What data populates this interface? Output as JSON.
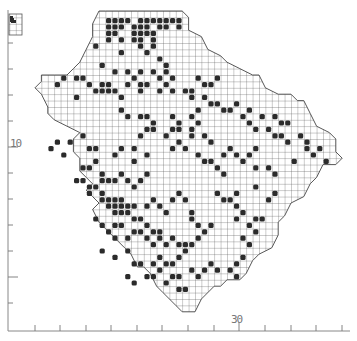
{
  "map": {
    "type": "grid-distribution-map",
    "colors": {
      "background": "#ffffff",
      "grid": "#555555",
      "filled": "#2b2b2b",
      "axis": "#777777",
      "outline": "#444444"
    },
    "grid": {
      "x0": 9.4,
      "y0": 4.6,
      "cell": 6.4
    },
    "axis": {
      "y_label": "10",
      "x_label": "30",
      "x_ticks": [
        35,
        60,
        86,
        111,
        137,
        162,
        188,
        214,
        239,
        265,
        291,
        316,
        342
      ],
      "y_ticks": [
        43,
        69,
        95,
        121,
        147,
        173,
        199,
        225,
        251,
        277,
        303
      ]
    },
    "outline": [
      [
        14,
        1
      ],
      [
        15,
        1
      ],
      [
        17,
        1
      ],
      [
        20,
        1
      ],
      [
        22,
        1
      ],
      [
        24,
        1
      ],
      [
        27,
        1
      ],
      [
        28,
        2
      ],
      [
        28,
        4
      ],
      [
        30,
        5
      ],
      [
        31,
        7
      ],
      [
        33,
        8
      ],
      [
        34,
        9
      ],
      [
        36,
        10
      ],
      [
        38,
        11
      ],
      [
        39,
        11
      ],
      [
        40,
        13
      ],
      [
        42,
        14
      ],
      [
        44,
        14
      ],
      [
        45,
        15
      ],
      [
        46,
        15
      ],
      [
        47,
        17
      ],
      [
        48,
        19
      ],
      [
        50,
        20
      ],
      [
        51,
        21
      ],
      [
        51,
        23
      ],
      [
        52,
        24
      ],
      [
        51,
        25
      ],
      [
        49,
        25
      ],
      [
        48,
        27
      ],
      [
        47,
        28
      ],
      [
        46,
        30
      ],
      [
        44,
        31
      ],
      [
        43,
        33
      ],
      [
        42,
        34
      ],
      [
        42,
        36
      ],
      [
        41,
        38
      ],
      [
        39,
        39
      ],
      [
        38,
        40
      ],
      [
        37,
        42
      ],
      [
        36,
        43
      ],
      [
        34,
        43
      ],
      [
        33,
        44
      ],
      [
        32,
        44
      ],
      [
        30,
        46
      ],
      [
        29,
        48
      ],
      [
        27,
        48
      ],
      [
        26,
        47
      ],
      [
        24,
        45
      ],
      [
        23,
        44
      ],
      [
        22,
        42
      ],
      [
        21,
        41
      ],
      [
        20,
        41
      ],
      [
        19,
        39
      ],
      [
        18,
        38
      ],
      [
        17,
        37
      ],
      [
        16,
        36
      ],
      [
        15,
        35
      ],
      [
        14,
        34
      ],
      [
        13,
        32
      ],
      [
        14,
        31
      ],
      [
        13,
        30
      ],
      [
        12,
        29
      ],
      [
        13,
        28
      ],
      [
        12,
        27
      ],
      [
        11,
        26
      ],
      [
        11,
        24
      ],
      [
        10,
        23
      ],
      [
        10,
        21
      ],
      [
        11,
        20
      ],
      [
        9,
        19
      ],
      [
        7,
        18
      ],
      [
        6,
        17
      ],
      [
        6,
        16
      ],
      [
        5,
        14
      ],
      [
        4,
        13
      ],
      [
        5,
        12
      ],
      [
        5,
        11
      ],
      [
        7,
        11
      ],
      [
        9,
        11
      ],
      [
        10,
        10
      ],
      [
        11,
        9
      ],
      [
        12,
        7
      ],
      [
        13,
        5
      ],
      [
        13,
        3
      ],
      [
        14,
        1
      ]
    ],
    "inset": {
      "x": 9,
      "y": 14,
      "w": 13,
      "h": 21
    },
    "inset_filled": [
      [
        10,
        16
      ],
      [
        10,
        17
      ],
      [
        11,
        18
      ],
      [
        10,
        19
      ],
      [
        11,
        20
      ],
      [
        12,
        20
      ],
      [
        13,
        20
      ]
    ],
    "filled": [
      [
        15,
        2
      ],
      [
        16,
        2
      ],
      [
        17,
        2
      ],
      [
        18,
        2
      ],
      [
        20,
        2
      ],
      [
        21,
        2
      ],
      [
        22,
        2
      ],
      [
        23,
        2
      ],
      [
        24,
        2
      ],
      [
        25,
        2
      ],
      [
        26,
        2
      ],
      [
        15,
        3
      ],
      [
        16,
        3
      ],
      [
        17,
        3
      ],
      [
        19,
        3
      ],
      [
        20,
        3
      ],
      [
        21,
        3
      ],
      [
        23,
        3
      ],
      [
        24,
        3
      ],
      [
        26,
        3
      ],
      [
        15,
        4
      ],
      [
        16,
        4
      ],
      [
        19,
        4
      ],
      [
        20,
        4
      ],
      [
        21,
        4
      ],
      [
        22,
        4
      ],
      [
        15,
        5
      ],
      [
        17,
        5
      ],
      [
        19,
        5
      ],
      [
        20,
        5
      ],
      [
        22,
        5
      ],
      [
        20,
        6
      ],
      [
        22,
        6
      ],
      [
        21,
        7
      ],
      [
        23,
        8
      ],
      [
        24,
        9
      ],
      [
        24,
        10
      ],
      [
        23,
        11
      ],
      [
        25,
        11
      ],
      [
        13,
        6
      ],
      [
        17,
        7
      ],
      [
        14,
        9
      ],
      [
        16,
        10
      ],
      [
        18,
        10
      ],
      [
        20,
        10
      ],
      [
        22,
        10
      ],
      [
        21,
        12
      ],
      [
        23,
        13
      ],
      [
        20,
        13
      ],
      [
        14,
        12
      ],
      [
        8,
        11
      ],
      [
        10,
        11
      ],
      [
        11,
        11
      ],
      [
        12,
        12
      ],
      [
        13,
        13
      ],
      [
        14,
        13
      ],
      [
        15,
        13
      ],
      [
        16,
        13
      ],
      [
        15,
        12
      ],
      [
        17,
        14
      ],
      [
        18,
        12
      ],
      [
        19,
        11
      ],
      [
        20,
        12
      ],
      [
        24,
        12
      ],
      [
        25,
        13
      ],
      [
        27,
        13
      ],
      [
        28,
        13
      ],
      [
        29,
        11
      ],
      [
        30,
        12
      ],
      [
        31,
        12
      ],
      [
        32,
        11
      ],
      [
        30,
        14
      ],
      [
        31,
        15
      ],
      [
        29,
        16
      ],
      [
        28,
        14
      ],
      [
        7,
        12
      ],
      [
        10,
        14
      ],
      [
        17,
        16
      ],
      [
        18,
        17
      ],
      [
        20,
        17
      ],
      [
        21,
        17
      ],
      [
        22,
        18
      ],
      [
        21,
        19
      ],
      [
        22,
        19
      ],
      [
        20,
        20
      ],
      [
        25,
        17
      ],
      [
        26,
        18
      ],
      [
        25,
        19
      ],
      [
        26,
        19
      ],
      [
        24,
        20
      ],
      [
        28,
        17
      ],
      [
        29,
        18
      ],
      [
        28,
        19
      ],
      [
        28,
        20
      ],
      [
        30,
        20
      ],
      [
        31,
        21
      ],
      [
        26,
        21
      ],
      [
        25,
        22
      ],
      [
        27,
        22
      ],
      [
        32,
        15
      ],
      [
        33,
        16
      ],
      [
        34,
        16
      ],
      [
        35,
        15
      ],
      [
        36,
        17
      ],
      [
        37,
        16
      ],
      [
        37,
        18
      ],
      [
        38,
        19
      ],
      [
        39,
        17
      ],
      [
        41,
        17
      ],
      [
        42,
        18
      ],
      [
        43,
        18
      ],
      [
        40,
        19
      ],
      [
        41,
        20
      ],
      [
        42,
        20
      ],
      [
        43,
        21
      ],
      [
        45,
        20
      ],
      [
        46,
        21
      ],
      [
        46,
        22
      ],
      [
        47,
        23
      ],
      [
        48,
        22
      ],
      [
        49,
        24
      ],
      [
        44,
        24
      ],
      [
        40,
        25
      ],
      [
        41,
        26
      ],
      [
        33,
        23
      ],
      [
        34,
        22
      ],
      [
        35,
        23
      ],
      [
        36,
        24
      ],
      [
        37,
        23
      ],
      [
        38,
        22
      ],
      [
        38,
        25
      ],
      [
        29,
        23
      ],
      [
        30,
        24
      ],
      [
        31,
        24
      ],
      [
        32,
        25
      ],
      [
        33,
        26
      ],
      [
        7,
        21
      ],
      [
        9,
        21
      ],
      [
        11,
        20
      ],
      [
        12,
        22
      ],
      [
        13,
        22
      ],
      [
        13,
        24
      ],
      [
        16,
        23
      ],
      [
        17,
        22
      ],
      [
        19,
        22
      ],
      [
        19,
        24
      ],
      [
        21,
        23
      ],
      [
        6,
        22
      ],
      [
        8,
        23
      ],
      [
        11,
        25
      ],
      [
        12,
        25
      ],
      [
        14,
        26
      ],
      [
        14,
        27
      ],
      [
        15,
        27
      ],
      [
        16,
        27
      ],
      [
        17,
        26
      ],
      [
        18,
        27
      ],
      [
        19,
        28
      ],
      [
        20,
        27
      ],
      [
        21,
        26
      ],
      [
        10,
        27
      ],
      [
        11,
        27
      ],
      [
        12,
        28
      ],
      [
        13,
        28
      ],
      [
        12,
        29
      ],
      [
        14,
        29
      ],
      [
        14,
        30
      ],
      [
        15,
        30
      ],
      [
        16,
        30
      ],
      [
        17,
        30
      ],
      [
        15,
        31
      ],
      [
        16,
        31
      ],
      [
        17,
        31
      ],
      [
        18,
        31
      ],
      [
        19,
        31
      ],
      [
        16,
        32
      ],
      [
        17,
        32
      ],
      [
        18,
        32
      ],
      [
        19,
        33
      ],
      [
        20,
        33
      ],
      [
        13,
        33
      ],
      [
        14,
        34
      ],
      [
        15,
        35
      ],
      [
        16,
        34
      ],
      [
        17,
        34
      ],
      [
        16,
        36
      ],
      [
        18,
        36
      ],
      [
        19,
        35
      ],
      [
        21,
        31
      ],
      [
        22,
        30
      ],
      [
        23,
        31
      ],
      [
        24,
        32
      ],
      [
        25,
        30
      ],
      [
        26,
        29
      ],
      [
        27,
        30
      ],
      [
        20,
        35
      ],
      [
        21,
        34
      ],
      [
        22,
        35
      ],
      [
        23,
        35
      ],
      [
        21,
        36
      ],
      [
        22,
        37
      ],
      [
        23,
        36
      ],
      [
        24,
        37
      ],
      [
        25,
        36
      ],
      [
        26,
        37
      ],
      [
        27,
        37
      ],
      [
        28,
        32
      ],
      [
        28,
        33
      ],
      [
        29,
        34
      ],
      [
        30,
        35
      ],
      [
        31,
        34
      ],
      [
        29,
        36
      ],
      [
        28,
        37
      ],
      [
        34,
        30
      ],
      [
        35,
        31
      ],
      [
        36,
        32
      ],
      [
        35,
        33
      ],
      [
        37,
        34
      ],
      [
        38,
        35
      ],
      [
        36,
        36
      ],
      [
        37,
        37
      ],
      [
        38,
        33
      ],
      [
        39,
        33
      ],
      [
        32,
        29
      ],
      [
        33,
        30
      ],
      [
        35,
        29
      ],
      [
        40,
        30
      ],
      [
        41,
        29
      ],
      [
        38,
        28
      ],
      [
        14,
        38
      ],
      [
        16,
        39
      ],
      [
        18,
        38
      ],
      [
        19,
        40
      ],
      [
        20,
        40
      ],
      [
        22,
        40
      ],
      [
        23,
        39
      ],
      [
        24,
        40
      ],
      [
        25,
        40
      ],
      [
        27,
        38
      ],
      [
        26,
        39
      ],
      [
        21,
        42
      ],
      [
        22,
        42
      ],
      [
        23,
        41
      ],
      [
        25,
        42
      ],
      [
        26,
        42
      ],
      [
        28,
        41
      ],
      [
        29,
        42
      ],
      [
        30,
        41
      ],
      [
        31,
        40
      ],
      [
        32,
        41
      ],
      [
        35,
        40
      ],
      [
        36,
        39
      ],
      [
        24,
        43
      ],
      [
        26,
        44
      ],
      [
        27,
        44
      ],
      [
        35,
        42
      ],
      [
        34,
        41
      ],
      [
        18,
        42
      ],
      [
        19,
        43
      ]
    ]
  }
}
